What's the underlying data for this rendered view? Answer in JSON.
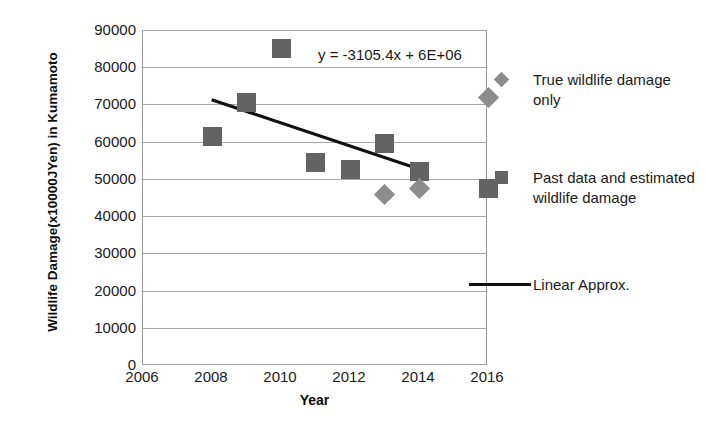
{
  "chart_data": {
    "type": "scatter",
    "title": "",
    "xlabel": "Year",
    "ylabel": "Wildlife Damage(x10000JYen) in Kumamoto",
    "xlim": [
      2006,
      2016
    ],
    "ylim": [
      0,
      90000
    ],
    "xticks": [
      2006,
      2008,
      2010,
      2012,
      2014,
      2016
    ],
    "yticks": [
      0,
      10000,
      20000,
      30000,
      40000,
      50000,
      60000,
      70000,
      80000,
      90000
    ],
    "grid": "horizontal",
    "legend_position": "right",
    "annotations": [
      {
        "text": "y = -3105.4x + 6E+06",
        "x": 2011.1,
        "y": 78000
      }
    ],
    "series": [
      {
        "name": "Past data and estimated wildlife damage",
        "marker": "square",
        "color": "#636363",
        "points": [
          {
            "x": 2008,
            "y": 61500
          },
          {
            "x": 2009,
            "y": 70500
          },
          {
            "x": 2010,
            "y": 85000
          },
          {
            "x": 2011,
            "y": 54500
          },
          {
            "x": 2012,
            "y": 52500
          },
          {
            "x": 2013,
            "y": 59500
          },
          {
            "x": 2014,
            "y": 52000
          },
          {
            "x": 2016,
            "y": 47500
          }
        ]
      },
      {
        "name": "True wildlife damage only",
        "marker": "diamond",
        "color": "#8c8c8c",
        "points": [
          {
            "x": 2013,
            "y": 45800
          },
          {
            "x": 2014,
            "y": 47500
          },
          {
            "x": 2016,
            "y": 72000
          }
        ]
      },
      {
        "name": "Linear Approx.",
        "marker": "line",
        "color": "#111111",
        "equation": "y = -3105.4x + 6E+06",
        "line": [
          {
            "x": 2008.0,
            "y": 71300
          },
          {
            "x": 2014.0,
            "y": 52700
          }
        ]
      }
    ]
  },
  "axes": {
    "y_title": "Wildlife Damage(x10000JYen) in Kumamoto",
    "x_title": "Year",
    "y_ticks": [
      "90000",
      "80000",
      "70000",
      "60000",
      "50000",
      "40000",
      "30000",
      "20000",
      "10000",
      "0"
    ],
    "x_ticks": [
      "2006",
      "2008",
      "2010",
      "2012",
      "2014",
      "2016"
    ]
  },
  "equation_label": "y = -3105.4x + 6E+06",
  "legend": {
    "items": [
      {
        "key": "diamond-marker-icon",
        "label": "True wildlife damage only"
      },
      {
        "key": "square-marker-icon",
        "label": "Past data and estimated wildlife damage"
      },
      {
        "key": "line-marker-icon",
        "label": "Linear Approx."
      }
    ]
  },
  "colors": {
    "square_marker": "#636363",
    "diamond_marker": "#8c8c8c",
    "trend_line": "#111111",
    "gridline": "#a6a6a6",
    "background": "#ffffff"
  }
}
